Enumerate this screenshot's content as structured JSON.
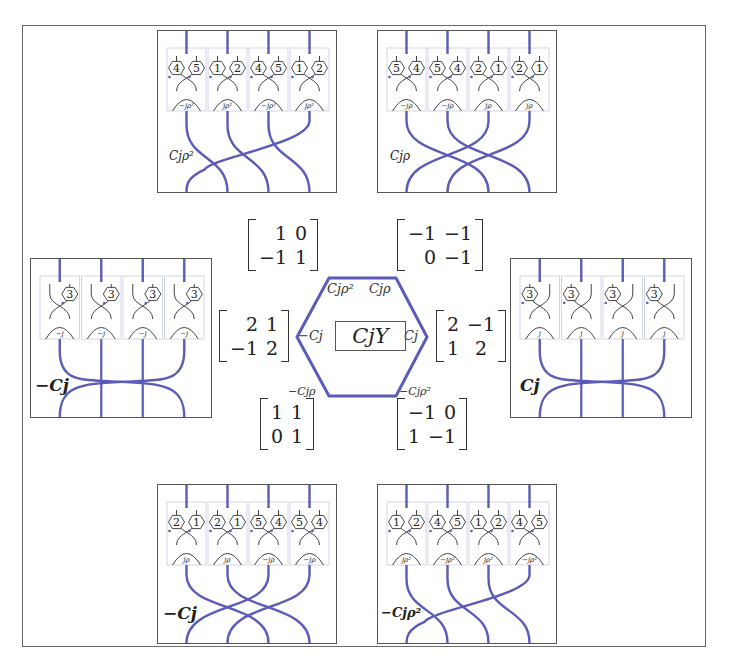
{
  "figure": {
    "center_label": "CjY",
    "hexagon": {
      "stroke_color": "#5b5bb8",
      "vertex_labels": {
        "top_left": "Cjρ²",
        "top_right": "Cjρ",
        "left": "−Cj",
        "right": "Cj",
        "bottom_left": "−Cjρ",
        "bottom_right": "−Cjρ²"
      }
    },
    "matrices": [
      {
        "position": "upper-left",
        "rows": [
          [
            "1",
            "0"
          ],
          [
            "−1",
            "1"
          ]
        ]
      },
      {
        "position": "upper-right",
        "rows": [
          [
            "−1",
            "−1"
          ],
          [
            "0",
            "−1"
          ]
        ]
      },
      {
        "position": "left",
        "rows": [
          [
            "2",
            "1"
          ],
          [
            "−1",
            "2"
          ]
        ]
      },
      {
        "position": "right",
        "rows": [
          [
            "2",
            "−1"
          ],
          [
            "1",
            "2"
          ]
        ]
      },
      {
        "position": "lower-left",
        "rows": [
          [
            "1",
            "1"
          ],
          [
            "0",
            "1"
          ]
        ]
      },
      {
        "position": "lower-right",
        "rows": [
          [
            "−1",
            "0"
          ],
          [
            "1",
            "−1"
          ]
        ]
      }
    ],
    "panels": [
      {
        "position": "top-left",
        "label": "Cjρ²",
        "cells": [
          {
            "nodes": [
              "4",
              "5"
            ],
            "crossing_label": "−jρ²"
          },
          {
            "nodes": [
              "1",
              "2"
            ],
            "crossing_label": "jρ²"
          },
          {
            "nodes": [
              "4",
              "5"
            ],
            "crossing_label": "−jρ²"
          },
          {
            "nodes": [
              "1",
              "2"
            ],
            "crossing_label": "jρ²"
          }
        ]
      },
      {
        "position": "top-right",
        "label": "Cjρ",
        "cells": [
          {
            "nodes": [
              "5",
              "4"
            ],
            "crossing_label": "−jρ"
          },
          {
            "nodes": [
              "5",
              "4"
            ],
            "crossing_label": "−jρ"
          },
          {
            "nodes": [
              "2",
              "1"
            ],
            "crossing_label": "jρ"
          },
          {
            "nodes": [
              "2",
              "1"
            ],
            "crossing_label": "jρ"
          }
        ]
      },
      {
        "position": "left",
        "label": "−Cj",
        "cells": [
          {
            "nodes": [
              "3"
            ],
            "crossing_label": "−j"
          },
          {
            "nodes": [
              "3"
            ],
            "crossing_label": "−j"
          },
          {
            "nodes": [
              "3"
            ],
            "crossing_label": "−j"
          },
          {
            "nodes": [
              "3"
            ],
            "crossing_label": "−j"
          }
        ]
      },
      {
        "position": "right",
        "label": "Cj",
        "cells": [
          {
            "nodes": [
              "3"
            ],
            "crossing_label": "j"
          },
          {
            "nodes": [
              "3"
            ],
            "crossing_label": "j"
          },
          {
            "nodes": [
              "3"
            ],
            "crossing_label": "j"
          },
          {
            "nodes": [
              "3"
            ],
            "crossing_label": "j"
          }
        ]
      },
      {
        "position": "bottom-left",
        "label": "−Cj",
        "cells": [
          {
            "nodes": [
              "2",
              "1"
            ],
            "crossing_label": "jρ"
          },
          {
            "nodes": [
              "2",
              "1"
            ],
            "crossing_label": "jρ"
          },
          {
            "nodes": [
              "5",
              "4"
            ],
            "crossing_label": "−jρ"
          },
          {
            "nodes": [
              "5",
              "4"
            ],
            "crossing_label": "−jρ"
          }
        ]
      },
      {
        "position": "bottom-right",
        "label": "−Cjρ²",
        "cells": [
          {
            "nodes": [
              "1",
              "2"
            ],
            "crossing_label": "jρ²"
          },
          {
            "nodes": [
              "4",
              "5"
            ],
            "crossing_label": "−jρ²"
          },
          {
            "nodes": [
              "1",
              "2"
            ],
            "crossing_label": "jρ²"
          },
          {
            "nodes": [
              "4",
              "5"
            ],
            "crossing_label": "−jρ²"
          }
        ]
      }
    ],
    "colors": {
      "strand": "#5b5bb8",
      "inner_line": "#555555",
      "frame": "#6a6a6a",
      "cell_border": "#c8cbe0"
    }
  }
}
